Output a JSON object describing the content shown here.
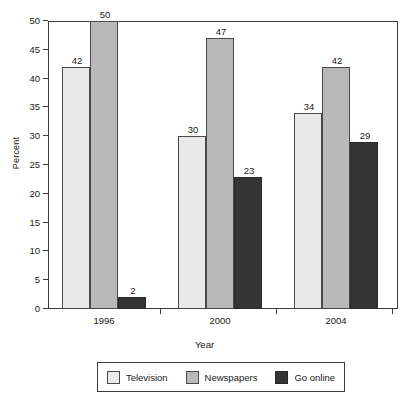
{
  "chart_data": {
    "type": "bar",
    "title": "",
    "xlabel": "Year",
    "ylabel": "Percent",
    "categories": [
      "1996",
      "2000",
      "2004"
    ],
    "series": [
      {
        "name": "Television",
        "values": [
          42,
          50,
          null
        ],
        "color": "#e9e9e9"
      },
      {
        "name": "Newspapers",
        "values": [
          50,
          47,
          42
        ],
        "color": "#b9b9b9"
      },
      {
        "name": "Go online",
        "values": [
          2,
          23,
          29
        ],
        "color": "#353535"
      }
    ],
    "series_by_group": [
      {
        "category": "1996",
        "values": [
          42,
          50,
          2
        ]
      },
      {
        "category": "2000",
        "values": [
          30,
          47,
          23
        ]
      },
      {
        "category": "2004",
        "values": [
          34,
          42,
          29
        ]
      }
    ],
    "ylim": [
      0,
      50
    ],
    "yticks": [
      0,
      5,
      10,
      15,
      20,
      25,
      30,
      35,
      40,
      45,
      50
    ],
    "ytick_labels": [
      "0",
      "5",
      "10",
      "15",
      "20",
      "25",
      "30",
      "35",
      "40",
      "45",
      "50"
    ],
    "grid": false,
    "legend_position": "bottom",
    "bar_value_labels": [
      [
        "42",
        "50",
        "2"
      ],
      [
        "30",
        "47",
        "23"
      ],
      [
        "34",
        "42",
        "29"
      ]
    ]
  },
  "legend": {
    "entries": [
      {
        "label": "Television"
      },
      {
        "label": "Newspapers"
      },
      {
        "label": "Go online"
      }
    ]
  }
}
